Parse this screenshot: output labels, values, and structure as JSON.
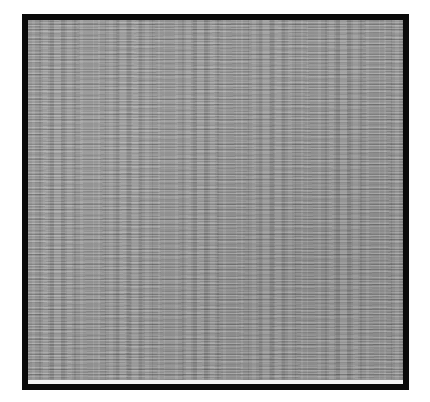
{
  "image": {
    "description": "Square gray noise texture framed by a thick black border",
    "colors": {
      "background": "#ffffff",
      "border": "#0a0a0a",
      "texture_base": "#8f8f8f",
      "bottom_strip": "#f4f4f4"
    }
  }
}
